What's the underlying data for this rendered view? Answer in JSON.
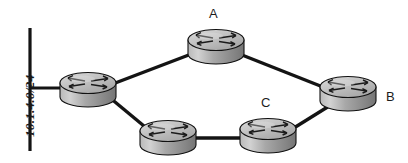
{
  "diagram": {
    "type": "network-topology",
    "width": 408,
    "height": 163,
    "background_color": "#ffffff",
    "line_color": "#141414",
    "label_color": "#1c1c1c",
    "router_body_color": "#9e9e9e",
    "router_top_color": "#c8c8c8",
    "router_outline_color": "#111111",
    "segments": [
      {
        "name": "ethernet-segment",
        "label": "10.1.4.0/24",
        "orientation": "vertical",
        "x": 30,
        "y_top": 28,
        "y_bottom": 151,
        "label_x": 22,
        "label_y": 137
      }
    ],
    "routers": [
      {
        "id": "left",
        "label": "",
        "cx": 88,
        "cy": 88,
        "label_x": 0,
        "label_y": 0
      },
      {
        "id": "top",
        "label": "A",
        "cx": 216,
        "cy": 45,
        "label_x": 209,
        "label_y": 7
      },
      {
        "id": "right",
        "label": "B",
        "cx": 348,
        "cy": 92,
        "label_x": 386,
        "label_y": 90
      },
      {
        "id": "bottom-left",
        "label": "",
        "cx": 168,
        "cy": 136,
        "label_x": 0,
        "label_y": 0
      },
      {
        "id": "bottom-mid",
        "label": "C",
        "cx": 268,
        "cy": 134,
        "label_x": 261,
        "label_y": 96
      }
    ],
    "links": [
      {
        "name": "link-segment-to-left",
        "from": "ethernet-segment",
        "to": "left",
        "x1": 30,
        "y1": 88,
        "x2": 62,
        "y2": 88
      },
      {
        "name": "link-left-to-a",
        "from": "left",
        "to": "top",
        "x1": 112,
        "y1": 84,
        "x2": 192,
        "y2": 54
      },
      {
        "name": "link-a-to-b",
        "from": "top",
        "to": "right",
        "x1": 242,
        "y1": 55,
        "x2": 326,
        "y2": 88
      },
      {
        "name": "link-left-to-bottom-left",
        "from": "left",
        "to": "bottom-left",
        "x1": 110,
        "y1": 98,
        "x2": 148,
        "y2": 130
      },
      {
        "name": "link-bottom-left-to-c",
        "from": "bottom-left",
        "to": "bottom-mid",
        "x1": 192,
        "y1": 138,
        "x2": 246,
        "y2": 138
      },
      {
        "name": "link-c-to-b",
        "from": "bottom-mid",
        "to": "right",
        "x1": 290,
        "y1": 130,
        "x2": 332,
        "y2": 104
      }
    ]
  }
}
